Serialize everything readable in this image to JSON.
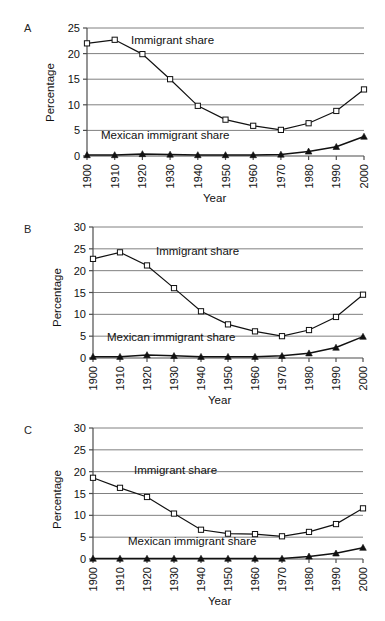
{
  "figure": {
    "panel_letters": [
      "A",
      "B",
      "C"
    ],
    "axis_titles": {
      "x": "Year",
      "y": "Percentage"
    },
    "series_labels": {
      "immigrant": "Immigrant share",
      "mexican": "Mexican immigrant share"
    },
    "colors": {
      "line": "#111111",
      "grid": "#808080",
      "axis": "#4d4d4d",
      "marker_fill": "#ffffff"
    },
    "caption": ""
  },
  "chart_data": [
    {
      "type": "line",
      "panel": "A",
      "title": "",
      "xlabel": "Year",
      "ylabel": "Percentage",
      "categories": [
        1900,
        1910,
        1920,
        1930,
        1940,
        1950,
        1960,
        1970,
        1980,
        1990,
        2000
      ],
      "xticklabels": [
        "1900",
        "1910",
        "1920",
        "1930",
        "1940",
        "1950",
        "1960",
        "1970",
        "1980",
        "1990",
        "2000"
      ],
      "yticklabels": [
        "0",
        "5",
        "10",
        "15",
        "20",
        "25"
      ],
      "ylim": [
        0,
        25
      ],
      "ytick_step": 5,
      "grid": true,
      "legend_position": "inline-annotation",
      "series": [
        {
          "name": "Immigrant share",
          "marker": "square-open",
          "values": [
            22.0,
            22.7,
            19.9,
            15.0,
            9.8,
            7.1,
            5.9,
            5.1,
            6.4,
            8.8,
            13.0
          ]
        },
        {
          "name": "Mexican immigrant share",
          "marker": "triangle-filled",
          "values": [
            0.2,
            0.2,
            0.4,
            0.3,
            0.2,
            0.2,
            0.2,
            0.3,
            0.9,
            1.8,
            3.8
          ]
        }
      ]
    },
    {
      "type": "line",
      "panel": "B",
      "title": "",
      "xlabel": "Year",
      "ylabel": "Percentage",
      "categories": [
        1900,
        1910,
        1920,
        1930,
        1940,
        1950,
        1960,
        1970,
        1980,
        1990,
        2000
      ],
      "xticklabels": [
        "1900",
        "1910",
        "1920",
        "1930",
        "1940",
        "1950",
        "1960",
        "1970",
        "1980",
        "1990",
        "2000"
      ],
      "yticklabels": [
        "0",
        "5",
        "10",
        "15",
        "20",
        "25",
        "30"
      ],
      "ylim": [
        0,
        30
      ],
      "ytick_step": 5,
      "grid": true,
      "legend_position": "inline-annotation",
      "series": [
        {
          "name": "Immigrant share",
          "marker": "square-open",
          "values": [
            22.7,
            24.2,
            21.2,
            16.0,
            10.7,
            7.7,
            6.1,
            5.0,
            6.4,
            9.4,
            14.5
          ]
        },
        {
          "name": "Mexican immigrant share",
          "marker": "triangle-filled",
          "values": [
            0.3,
            0.3,
            0.7,
            0.5,
            0.3,
            0.3,
            0.3,
            0.5,
            1.1,
            2.4,
            4.9
          ]
        }
      ]
    },
    {
      "type": "line",
      "panel": "C",
      "title": "",
      "xlabel": "Year",
      "ylabel": "Percentage",
      "categories": [
        1900,
        1910,
        1920,
        1930,
        1940,
        1950,
        1960,
        1970,
        1980,
        1990,
        2000
      ],
      "xticklabels": [
        "1900",
        "1910",
        "1920",
        "1930",
        "1940",
        "1950",
        "1960",
        "1970",
        "1980",
        "1990",
        "2000"
      ],
      "yticklabels": [
        "0",
        "5",
        "10",
        "15",
        "20",
        "25",
        "30"
      ],
      "ylim": [
        0,
        30
      ],
      "ytick_step": 5,
      "grid": true,
      "legend_position": "inline-annotation",
      "series": [
        {
          "name": "Immigrant share",
          "marker": "square-open",
          "values": [
            18.6,
            16.3,
            14.2,
            10.4,
            6.7,
            5.8,
            5.7,
            5.2,
            6.2,
            8.0,
            11.6
          ]
        },
        {
          "name": "Mexican immigrant share",
          "marker": "triangle-filled",
          "values": [
            0.1,
            0.1,
            0.1,
            0.1,
            0.1,
            0.1,
            0.1,
            0.1,
            0.6,
            1.3,
            2.6
          ]
        }
      ]
    }
  ]
}
